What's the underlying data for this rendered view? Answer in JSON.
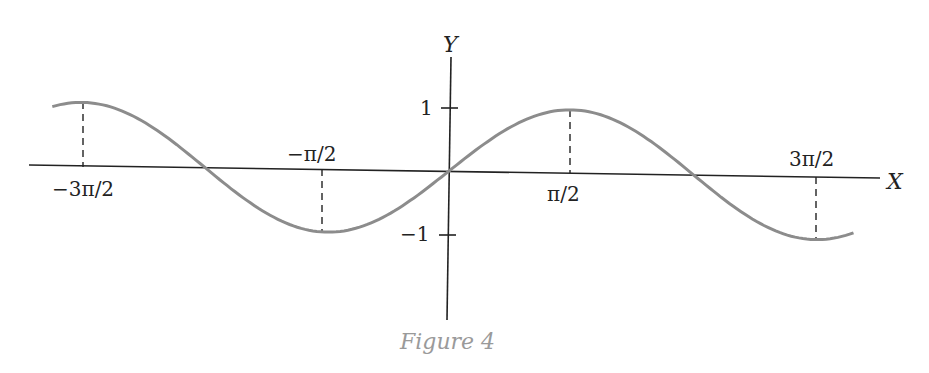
{
  "chart_data": {
    "type": "line",
    "title": "",
    "caption": "Figure 4",
    "xlabel": "X",
    "ylabel": "Y",
    "function": "y = sin(x)",
    "x_ticks": [
      {
        "label": "−3π/2",
        "value": -4.712
      },
      {
        "label": "−π/2",
        "value": -1.571
      },
      {
        "label": "π/2",
        "value": 1.571
      },
      {
        "label": "3π/2",
        "value": 4.712
      }
    ],
    "y_ticks": [
      {
        "label": "1",
        "value": 1
      },
      {
        "label": "−1",
        "value": -1
      }
    ],
    "series": [
      {
        "name": "sin x",
        "color": "#8c8c8c",
        "x": [
          -5.1,
          -4.712,
          -3.1416,
          -1.571,
          0,
          1.571,
          3.1416,
          4.712,
          5.2
        ],
        "values": [
          0.93,
          1,
          0,
          -1,
          0,
          1,
          0,
          -1,
          -0.88
        ]
      }
    ],
    "xlim": [
      -5.6,
      5.3
    ],
    "ylim": [
      -2.1,
      1.6
    ],
    "grid": false,
    "legend": "none",
    "annotations": [
      "dashed vertical lines from x-axis to curve at x = −3π/2, −π/2, π/2, 3π/2"
    ]
  },
  "labels": {
    "x_axis": "X",
    "y_axis": "Y",
    "tick_neg3pi2": "−3π/2",
    "tick_negpi2": "−π/2",
    "tick_pi2": "π/2",
    "tick_3pi2": "3π/2",
    "tick_y1": "1",
    "tick_yneg1": "−1",
    "caption": "Figure 4"
  },
  "colors": {
    "curve": "#8c8c8c",
    "axes": "#222222",
    "caption": "#9a9a9a"
  }
}
